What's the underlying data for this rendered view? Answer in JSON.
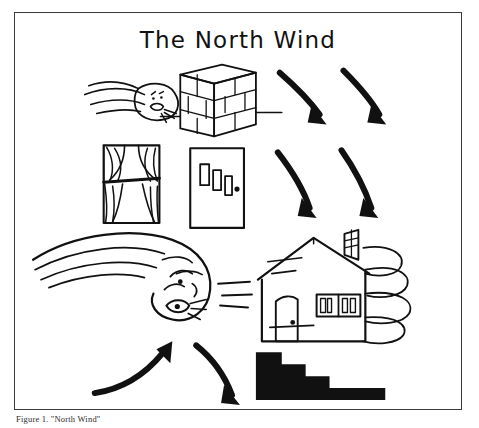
{
  "figure": {
    "title": "The North Wind",
    "caption": "Figure 1. \"North Wind\"",
    "frame_color": "#3a3a3a",
    "ink_color": "#111111",
    "background_color": "#ffffff",
    "rows": [
      {
        "row_index": 1,
        "items": [
          {
            "name": "wind-face-small",
            "label": "wind face blowing"
          },
          {
            "name": "brick-wall",
            "label": "brick wall"
          },
          {
            "name": "arrow-down-right-1",
            "label": "curved arrow"
          },
          {
            "name": "arrow-down-right-2",
            "label": "curved arrow"
          }
        ]
      },
      {
        "row_index": 2,
        "items": [
          {
            "name": "window-with-curtains",
            "label": "window with curtains"
          },
          {
            "name": "door",
            "label": "door"
          },
          {
            "name": "arrow-down-right-3",
            "label": "curved arrow"
          },
          {
            "name": "arrow-down-right-4",
            "label": "curved arrow"
          }
        ]
      },
      {
        "row_index": 3,
        "items": [
          {
            "name": "wind-face-large",
            "label": "large wind face blowing"
          },
          {
            "name": "house",
            "label": "house with chimney"
          }
        ]
      },
      {
        "row_index": 4,
        "items": [
          {
            "name": "arrow-up-right",
            "label": "curved arrow pointing up"
          },
          {
            "name": "arrow-down-right-5",
            "label": "curved arrow pointing down"
          },
          {
            "name": "descending-steps",
            "label": "descending steps"
          }
        ]
      }
    ]
  }
}
